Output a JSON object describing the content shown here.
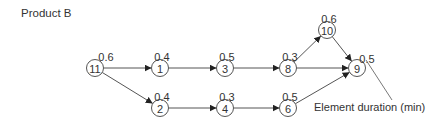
{
  "title": "Product B",
  "annotation": "Element duration (min)",
  "nodes": [
    {
      "id": "11",
      "duration": "0.6",
      "x": 95,
      "y": 68
    },
    {
      "id": "1",
      "duration": "0.4",
      "x": 160,
      "y": 68
    },
    {
      "id": "3",
      "duration": "0.5",
      "x": 225,
      "y": 68
    },
    {
      "id": "8",
      "duration": "0.3",
      "x": 288,
      "y": 68
    },
    {
      "id": "10",
      "duration": "0.6",
      "x": 327,
      "y": 30
    },
    {
      "id": "9",
      "duration": "0.5",
      "x": 357,
      "y": 68
    },
    {
      "id": "2",
      "duration": "0.4",
      "x": 160,
      "y": 108
    },
    {
      "id": "4",
      "duration": "0.3",
      "x": 225,
      "y": 108
    },
    {
      "id": "6",
      "duration": "0.5",
      "x": 288,
      "y": 108
    }
  ],
  "edges": [
    {
      "from": "11",
      "to": "1"
    },
    {
      "from": "11",
      "to": "2"
    },
    {
      "from": "1",
      "to": "3"
    },
    {
      "from": "3",
      "to": "8"
    },
    {
      "from": "8",
      "to": "10"
    },
    {
      "from": "8",
      "to": "9"
    },
    {
      "from": "10",
      "to": "9"
    },
    {
      "from": "2",
      "to": "4"
    },
    {
      "from": "4",
      "to": "6"
    },
    {
      "from": "6",
      "to": "9"
    }
  ]
}
